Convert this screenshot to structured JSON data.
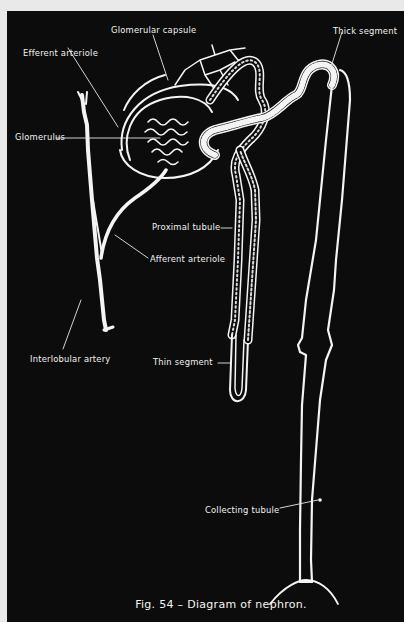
{
  "figure": {
    "caption": "Fig. 54 – Diagram of nephron.",
    "background": "#0c0c0c",
    "stroke": "#f4f4f4"
  },
  "labels": {
    "glomerular_capsule": "Glomerular capsule",
    "efferent_arteriole": "Efferent arteriole",
    "glomerulus": "Glomerulus",
    "thick_segment": "Thick segment",
    "proximal_tubule": "Proximal tubule",
    "afferent_arteriole": "Afferent arteriole",
    "interlobular_artery": "Interlobular artery",
    "thin_segment": "Thin segment",
    "collecting_tubule": "Collecting tubule"
  }
}
